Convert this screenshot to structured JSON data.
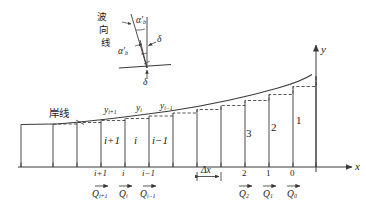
{
  "figure": {
    "type": "technical-diagram"
  },
  "inset": {
    "wave_line_label": "波向线",
    "wave_line_chars": [
      "波",
      "向",
      "线"
    ],
    "angle_top": "α",
    "angle_top_prime": "′",
    "angle_top_sub": "b",
    "angle_bottom": "α",
    "angle_bottom_prime": "′",
    "angle_bottom_sub": "b",
    "delta_right": "δ",
    "delta_bottom": "δ"
  },
  "main": {
    "shoreline_label": "岸线",
    "axis_x_label": "x",
    "axis_y_label": "y",
    "delta_x_label": "Δx",
    "y_labels": [
      {
        "base": "y",
        "sub": "i+1"
      },
      {
        "base": "y",
        "sub": "i"
      },
      {
        "base": "y",
        "sub": "i−1"
      }
    ],
    "cell_labels": [
      "i+1",
      "i",
      "i−1",
      "3",
      "2",
      "1"
    ],
    "node_indices": [
      "i+1",
      "i",
      "i−1",
      "2",
      "1",
      "0"
    ],
    "flux_labels": [
      {
        "base": "Q",
        "sub": "i+1"
      },
      {
        "base": "Q",
        "sub": "i"
      },
      {
        "base": "Q",
        "sub": "i−1"
      },
      {
        "base": "Q",
        "sub": "2"
      },
      {
        "base": "Q",
        "sub": "1"
      },
      {
        "base": "Q",
        "sub": "0"
      }
    ]
  },
  "colors": {
    "line": "#3a3a3a",
    "text": "#1a1a1a",
    "background": "#ffffff"
  }
}
